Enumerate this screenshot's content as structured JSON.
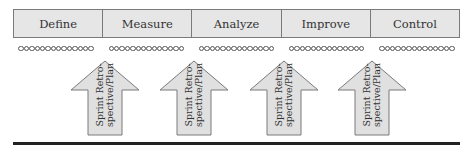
{
  "phases": [
    "Define",
    "Measure",
    "Analyze",
    "Improve",
    "Control"
  ],
  "dots_per_group": 14,
  "arrows": [
    {
      "line1": "Sprint Retro-",
      "line2": "spective/Plan",
      "center_x": 105
    },
    {
      "line1": "Sprint Retro-",
      "line2": "spective/Plan",
      "center_x": 194
    },
    {
      "line1": "Sprint Retro-",
      "line2": "spective/Plan",
      "center_x": 284
    },
    {
      "line1": "Sprint Retro-",
      "line2": "spective/Plan",
      "center_x": 372
    }
  ],
  "colors": {
    "box_fill": "#e6e6e6",
    "arrow_fill": "#e0e0e0",
    "stroke": "#7a7a7a",
    "baseline": "#222222"
  }
}
